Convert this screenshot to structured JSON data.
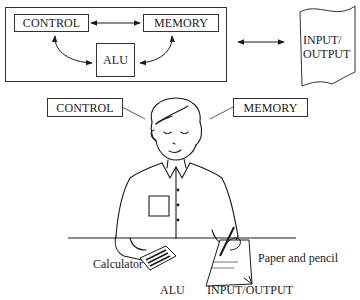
{
  "top_diagram": {
    "control_label": "CONTROL",
    "memory_label": "MEMORY",
    "alu_label": "ALU",
    "io_line1": "INPUT/",
    "io_line2": "OUTPUT"
  },
  "illustration": {
    "control_label": "CONTROL",
    "memory_label": "MEMORY",
    "calculator_label": "Calculator",
    "paper_pencil_label": "Paper and pencil",
    "alu_label": "ALU",
    "io_label": "INPUT/OUTPUT"
  },
  "colors": {
    "ink": "#1a1a1a",
    "background": "#ffffff"
  }
}
